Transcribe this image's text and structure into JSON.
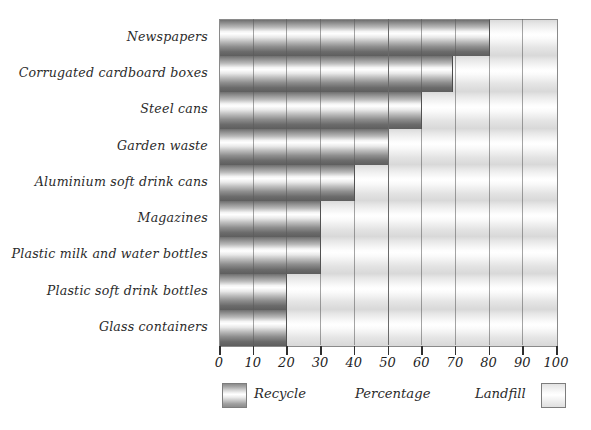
{
  "chart_data": {
    "type": "bar",
    "orientation": "horizontal",
    "stacked": true,
    "title": "",
    "xlabel": "Percentage",
    "ylabel": "",
    "xlim": [
      0,
      100
    ],
    "xticks": [
      0,
      10,
      20,
      30,
      40,
      50,
      60,
      70,
      80,
      90,
      100
    ],
    "xtick_labels": [
      "0",
      "10",
      "20",
      "30",
      "40",
      "50",
      "60",
      "70",
      "80",
      "90",
      "100"
    ],
    "grid": true,
    "grid_axis": "x",
    "legend_position": "bottom",
    "categories": [
      "Newspapers",
      "Corrugated cardboard boxes",
      "Steel cans",
      "Garden waste",
      "Aluminium soft drink cans",
      "Magazines",
      "Plastic milk and water bottles",
      "Plastic soft drink bottles",
      "Glass containers"
    ],
    "series": [
      {
        "name": "Recycle",
        "color": "#8d8d8d",
        "values": [
          80,
          69,
          60,
          50,
          40,
          30,
          30,
          20,
          20
        ]
      },
      {
        "name": "Landfill",
        "color": "#ececec",
        "values": [
          20,
          31,
          40,
          50,
          60,
          70,
          70,
          80,
          80
        ]
      }
    ]
  },
  "legend": {
    "recycle_label": "Recycle",
    "axis_label": "Percentage",
    "landfill_label": "Landfill"
  },
  "colors": {
    "recycle": "#8d8d8d",
    "landfill": "#ececec",
    "axis": "#2f2f2f",
    "gridline": "#6a6a6a",
    "text": "#2b2b2b"
  }
}
